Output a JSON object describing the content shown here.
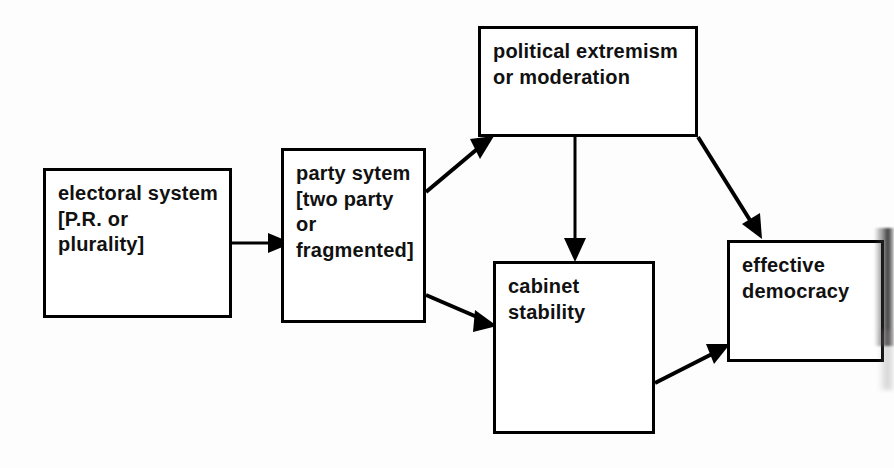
{
  "diagram": {
    "background_color": "#fdfdfd",
    "line_color": "#000000",
    "box_fill": "#ffffff",
    "nodes": [
      {
        "id": "electoral-system",
        "label": "electoral system\n[P.R. or\nplurality]",
        "x": 43,
        "y": 168,
        "width": 189,
        "height": 150
      },
      {
        "id": "party-system",
        "label": "party sytem\n[two party\nor\nfragmented]",
        "x": 281,
        "y": 148,
        "width": 145,
        "height": 175
      },
      {
        "id": "political-extremism",
        "label": "political  extremism\nor moderation",
        "x": 478,
        "y": 26,
        "width": 220,
        "height": 111
      },
      {
        "id": "cabinet-stability",
        "label": "cabinet\nstability",
        "x": 493,
        "y": 261,
        "width": 162,
        "height": 173
      },
      {
        "id": "effective-democracy",
        "label": "effective\ndemocracy",
        "x": 727,
        "y": 240,
        "width": 157,
        "height": 122
      }
    ],
    "edges": [
      {
        "id": "electoral-to-party",
        "from": "electoral-system",
        "to": "party-system",
        "path": "M 232 243 L 273 243",
        "arrow_at": "273,243",
        "arrow_angle": 0
      },
      {
        "id": "party-to-extremism",
        "from": "party-system",
        "to": "political-extremism",
        "path": "M 426 190 L 483 142",
        "arrow_at": "483,142",
        "arrow_angle": -40
      },
      {
        "id": "party-to-cabinet",
        "from": "party-system",
        "to": "cabinet-stability",
        "path": "M 426 296 L 492 324",
        "arrow_at": "492,324",
        "arrow_angle": 23
      },
      {
        "id": "extremism-to-cabinet",
        "from": "political-extremism",
        "to": "cabinet-stability",
        "path": "M 575 137 L 575 257",
        "arrow_at": "575,257",
        "arrow_angle": 90
      },
      {
        "id": "extremism-to-democracy",
        "from": "political-extremism",
        "to": "effective-democracy",
        "path": "M 698 137 L 758 235",
        "arrow_at": "758,235",
        "arrow_angle": 58
      },
      {
        "id": "cabinet-to-democracy",
        "from": "cabinet-stability",
        "to": "effective-democracy",
        "path": "M 655 382 L 723 348",
        "arrow_at": "723,348",
        "arrow_angle": -27
      }
    ]
  }
}
